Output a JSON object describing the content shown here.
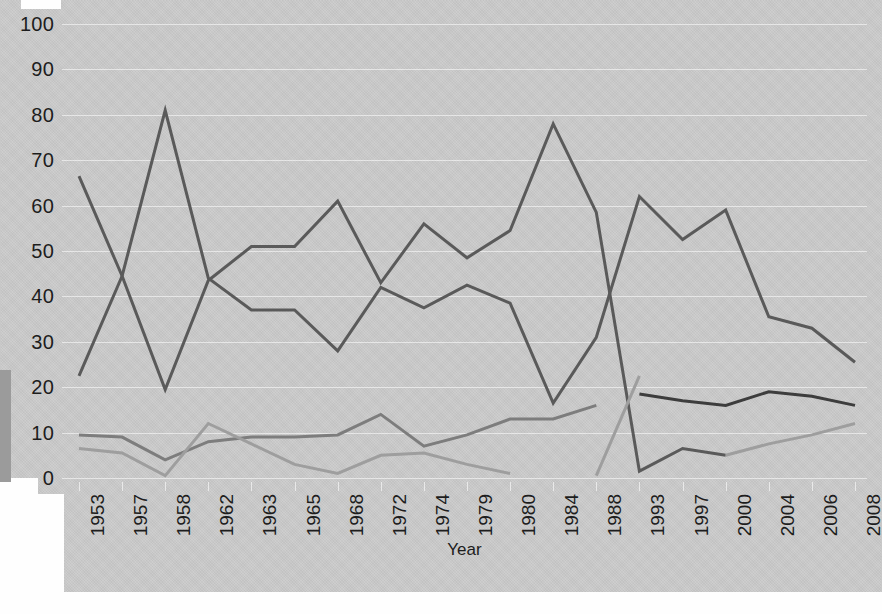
{
  "chart_data": {
    "type": "line",
    "title": "",
    "xlabel": "Year",
    "ylabel": "",
    "ylim": [
      0,
      100
    ],
    "y_ticks": [
      0,
      10,
      20,
      30,
      40,
      50,
      60,
      70,
      80,
      90,
      100
    ],
    "grid": true,
    "legend": "none",
    "categories": [
      "1953",
      "1957",
      "1958",
      "1962",
      "1963",
      "1965",
      "1968",
      "1972",
      "1974",
      "1979",
      "1980",
      "1984",
      "1988",
      "1993",
      "1997",
      "2000",
      "2004",
      "2006",
      "2008"
    ],
    "series": [
      {
        "name": "series-1",
        "color": "#5a5a5a",
        "values": [
          66.5,
          44.5,
          19.5,
          43.5,
          51.0,
          51.0,
          61.0,
          43.0,
          56.0,
          48.5,
          54.5,
          78.0,
          58.5,
          1.5,
          6.5,
          5.0,
          null,
          null,
          null
        ]
      },
      {
        "name": "series-2",
        "color": "#5a5a5a",
        "values": [
          22.5,
          44.5,
          81.0,
          44.0,
          37.0,
          37.0,
          28.0,
          42.0,
          37.5,
          42.5,
          38.5,
          16.5,
          31.0,
          62.0,
          52.5,
          59.0,
          35.5,
          33.0,
          25.5
        ]
      },
      {
        "name": "series-3",
        "color": "#7d7d7d",
        "values": [
          9.5,
          9.0,
          4.0,
          8.0,
          9.0,
          9.0,
          9.5,
          14.0,
          7.0,
          9.5,
          13.0,
          13.0,
          16.0,
          null,
          null,
          null,
          null,
          null,
          null
        ]
      },
      {
        "name": "series-4",
        "color": "#9e9e9e",
        "values": [
          6.5,
          5.5,
          0.5,
          12.0,
          7.5,
          3.0,
          1.0,
          5.0,
          5.5,
          3.0,
          1.0,
          null,
          0.5,
          22.5,
          null,
          5.0,
          7.5,
          9.5,
          12.0
        ]
      },
      {
        "name": "series-5",
        "color": "#3d3d3d",
        "values": [
          null,
          null,
          null,
          null,
          null,
          null,
          null,
          null,
          null,
          null,
          null,
          null,
          null,
          18.5,
          17.0,
          16.0,
          19.0,
          18.0,
          16.0
        ]
      }
    ]
  },
  "axis": {
    "y_labels": [
      "100",
      "90",
      "80",
      "70",
      "60",
      "50",
      "40",
      "30",
      "20",
      "10",
      "0"
    ],
    "x_labels": [
      "1953",
      "1957",
      "1958",
      "1962",
      "1963",
      "1965",
      "1968",
      "1972",
      "1974",
      "1979",
      "1980",
      "1984",
      "1988",
      "1993",
      "1997",
      "2000",
      "2004",
      "2006",
      "2008"
    ],
    "x_title": "Year"
  }
}
